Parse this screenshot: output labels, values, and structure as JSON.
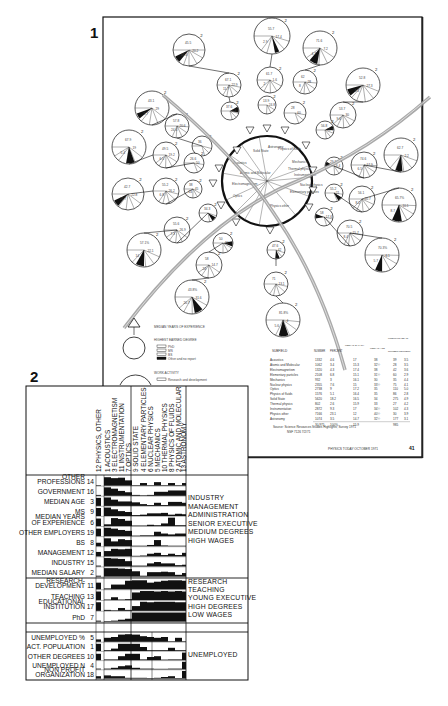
{
  "figure1": {
    "label": "1",
    "center_sectors": [
      "Solid State",
      "Acoustics",
      "Atomic and Molecular",
      "Electromagnetism",
      "Optics",
      "Physics other",
      "Astronomy",
      "Physics of fluids",
      "Nuclear physics",
      "Thermal physics",
      "Mechanics",
      "Instrumentation",
      "Elementary particles"
    ],
    "legend": {
      "median_years": "MEDIAN YEARS OF EXPERIENCE",
      "highest_degree": "HIGHEST EARNED DEGREE",
      "degree_items": [
        "PhD",
        "MS",
        "BS",
        "Other and no report"
      ],
      "work_activity": "WORK ACTIVITY",
      "work_items": [
        "Research and development"
      ]
    },
    "pies": [
      {
        "cx": 189,
        "cy": 50,
        "r": 16,
        "labels": [
          "45.5",
          "20.2",
          "41.4"
        ],
        "black": [
          160,
          185
        ]
      },
      {
        "cx": 272,
        "cy": 36,
        "r": 18,
        "labels": [
          "55.7",
          "17.4",
          "2.9"
        ],
        "black": [
          95,
          110
        ]
      },
      {
        "cx": 320,
        "cy": 48,
        "r": 17,
        "labels": [
          "71.6",
          "7.2",
          "4.7"
        ],
        "black": [
          130,
          160
        ]
      },
      {
        "cx": 229,
        "cy": 85,
        "r": 12,
        "labels": [
          "67.1",
          "22.9",
          "11.7"
        ],
        "black": null
      },
      {
        "cx": 270,
        "cy": 80,
        "r": 13,
        "labels": [
          "61.7",
          "1.6",
          "2"
        ],
        "black": null
      },
      {
        "cx": 305,
        "cy": 82,
        "r": 12,
        "labels": [
          "62",
          "28",
          "8"
        ],
        "black": null
      },
      {
        "cx": 363,
        "cy": 85,
        "r": 17,
        "labels": [
          "52.8",
          "27.3",
          "4.4"
        ],
        "black": [
          170,
          195
        ]
      },
      {
        "cx": 152,
        "cy": 108,
        "r": 17,
        "labels": [
          "43.1",
          "29",
          "5.7"
        ],
        "black": [
          170,
          190
        ]
      },
      {
        "cx": 230,
        "cy": 111,
        "r": 9,
        "labels": [
          "37.6",
          "4.4"
        ],
        "black": [
          0,
          40
        ]
      },
      {
        "cx": 267,
        "cy": 105,
        "r": 9,
        "labels": [
          "13.9",
          "24.8"
        ],
        "black": null
      },
      {
        "cx": 295,
        "cy": 113,
        "r": 11,
        "labels": [
          "28",
          "60"
        ],
        "black": null
      },
      {
        "cx": 343,
        "cy": 115,
        "r": 13,
        "labels": [
          "53.7",
          "30",
          "9.6"
        ],
        "black": null
      },
      {
        "cx": 177,
        "cy": 126,
        "r": 12,
        "labels": [
          "57.8",
          "20.6",
          "24.4"
        ],
        "black": null
      },
      {
        "cx": 325,
        "cy": 130,
        "r": 9,
        "labels": [
          "56.8",
          "33.3"
        ],
        "black": [
          0,
          30
        ]
      },
      {
        "cx": 129,
        "cy": 147,
        "r": 17,
        "labels": [
          "67.9",
          "19",
          "5.4"
        ],
        "black": [
          100,
          130
        ]
      },
      {
        "cx": 202,
        "cy": 146,
        "r": 10,
        "labels": [
          "36"
        ],
        "black": null
      },
      {
        "cx": 166,
        "cy": 155,
        "r": 13,
        "labels": [
          "49.5",
          "19.2",
          "6.5"
        ],
        "black": null
      },
      {
        "cx": 194,
        "cy": 163,
        "r": 10,
        "labels": [
          "26.6",
          "50"
        ],
        "black": null
      },
      {
        "cx": 334,
        "cy": 166,
        "r": 9,
        "labels": [
          "29.2",
          "9.4"
        ],
        "black": [
          210,
          240
        ]
      },
      {
        "cx": 364,
        "cy": 165,
        "r": 13,
        "labels": [
          "74.6",
          "17.9",
          "6.5"
        ],
        "black": null
      },
      {
        "cx": 401,
        "cy": 155,
        "r": 17,
        "labels": [
          "62.7",
          "2.2"
        ],
        "black": [
          115,
          140
        ]
      },
      {
        "cx": 128,
        "cy": 194,
        "r": 16,
        "labels": [
          "42.7",
          "22.8",
          "25.7"
        ],
        "black": [
          160,
          185
        ]
      },
      {
        "cx": 166,
        "cy": 191,
        "r": 13,
        "labels": [
          "55.2",
          "26.2",
          "6.8"
        ],
        "black": null
      },
      {
        "cx": 193,
        "cy": 189,
        "r": 9,
        "labels": [
          "38",
          "45",
          "24"
        ],
        "black": null
      },
      {
        "cx": 334,
        "cy": 193,
        "r": 9,
        "labels": [
          "55.2",
          "21"
        ],
        "black": [
          60,
          90
        ]
      },
      {
        "cx": 362,
        "cy": 199,
        "r": 13,
        "labels": [
          "56.1",
          "20.7",
          "8.2"
        ],
        "black": null
      },
      {
        "cx": 399,
        "cy": 205,
        "r": 17,
        "labels": [
          "65.7%",
          "10.1",
          "8.7"
        ],
        "black": [
          110,
          145
        ]
      },
      {
        "cx": 208,
        "cy": 213,
        "r": 9,
        "labels": [
          "34.3"
        ],
        "black": [
          60,
          90
        ]
      },
      {
        "cx": 177,
        "cy": 230,
        "r": 13,
        "labels": [
          "55.6",
          "26.9",
          "7.3"
        ],
        "black": null
      },
      {
        "cx": 324,
        "cy": 217,
        "r": 9,
        "labels": [
          "58",
          "17.6"
        ],
        "black": [
          200,
          230
        ]
      },
      {
        "cx": 223,
        "cy": 243,
        "r": 10,
        "labels": [
          "50",
          "24"
        ],
        "black": [
          20,
          50
        ]
      },
      {
        "cx": 350,
        "cy": 233,
        "r": 13,
        "labels": [
          "70.5",
          "15.7",
          "8.4"
        ],
        "black": null
      },
      {
        "cx": 144,
        "cy": 250,
        "r": 17,
        "labels": [
          "57.1%",
          "22.1",
          "14"
        ],
        "black": [
          120,
          150
        ]
      },
      {
        "cx": 382,
        "cy": 255,
        "r": 17,
        "labels": [
          "70.3%",
          "6.1",
          "5.7"
        ],
        "black": [
          120,
          145
        ]
      },
      {
        "cx": 276,
        "cy": 250,
        "r": 9,
        "labels": [
          "47.6",
          "42"
        ],
        "black": [
          95,
          125
        ]
      },
      {
        "cx": 209,
        "cy": 265,
        "r": 13,
        "labels": [
          "58",
          "14.7",
          "24"
        ],
        "black": null
      },
      {
        "cx": 276,
        "cy": 284,
        "r": 12,
        "labels": [
          "71",
          "13.1"
        ],
        "black": null
      },
      {
        "cx": 192,
        "cy": 297,
        "r": 17,
        "labels": [
          "43.8%",
          "31.6",
          "20.7"
        ],
        "black": [
          80,
          110
        ]
      },
      {
        "cx": 283,
        "cy": 320,
        "r": 17,
        "labels": [
          "81.8%",
          "4",
          "5.6"
        ],
        "black": [
          100,
          135
        ]
      }
    ],
    "table": {
      "headers": [
        "SUBFIELD",
        "NUMBER",
        "PERCENT",
        "MEDIAN SALARY (THOUSANDS OF DOLLARS)",
        "MEDIAN AGE",
        "UNEMPLOYED NUMBER",
        "UNEMPLOYED PERCENT"
      ],
      "rows": [
        [
          "Acoustics",
          "1332",
          "4.6",
          "17",
          "38",
          "39",
          "3.5"
        ],
        [
          "Atomic and Molecular",
          "1062",
          "3.4",
          "15.3",
          "32½",
          "28",
          "3.5"
        ],
        [
          "Electromagnetism",
          "1320",
          "4.3",
          "17.4",
          "38",
          "42",
          "3.6"
        ],
        [
          "Elementary particles",
          "2108",
          "6.8",
          "15.1",
          "31½",
          "60",
          "2.9"
        ],
        [
          "Mechanics",
          "932",
          "3",
          "16.1",
          "30",
          "35",
          "4.4"
        ],
        [
          "Nuclear physics",
          "2355",
          "7.6",
          "15",
          "33½",
          "75",
          "4.1"
        ],
        [
          "Optics",
          "2738",
          "9",
          "17.2",
          "35",
          "110",
          "5.0"
        ],
        [
          "Physics of fluids",
          "1576",
          "5.1",
          "16.4",
          "35",
          "86",
          "2.8"
        ],
        [
          "Solid State",
          "5620",
          "18.2",
          "16.5",
          "34",
          "275",
          "4.9"
        ],
        [
          "Thermal physics",
          "802",
          "2.6",
          "15.9",
          "33",
          "27",
          "4.2"
        ],
        [
          "Instrumentation",
          "2872",
          "9.3",
          "17",
          "34½",
          "102",
          "4.3"
        ],
        [
          "Physics other",
          "7166",
          "23.1",
          "12",
          "40½",
          "30",
          "3.9"
        ],
        [
          "Astronomy",
          "1074",
          "3.5",
          "14.7",
          "32½",
          "177",
          "3.1"
        ]
      ],
      "totals": [
        "",
        "30,975",
        "100%",
        "15.9",
        "",
        "985",
        ""
      ],
      "source": "Source: Science Resources Studies Highlights; Survey 1971",
      "source2": "NSF 7126  7/2/71",
      "footer": "PHYSICS TODAY   OCTOBER 1971",
      "page_number": "41"
    }
  },
  "figure2": {
    "label": "2",
    "columns": [
      "12 PHYSICS, OTHER",
      "1 ACOUSTICS",
      "3 ELECTROMAGNETISM",
      "11 INSTRUMENTATION",
      "7 OPTICS",
      "9 SOLID STATE",
      "4 ELEMENTARY PARTICLES",
      "6 NUCLEAR PHYSICS",
      "5 MECHANICS",
      "10 THERMAL PHYSICS",
      "8 PHYSICS OF FLUIDS",
      "2 ATOMIC AND MOLECULAR",
      "13 ASTRONOMY"
    ],
    "groups": [
      {
        "rows": [
          {
            "label": [
              "OTHER",
              "PROFESSIONS"
            ],
            "num": "14"
          },
          {
            "label": [
              "GOVERNMENT"
            ],
            "num": "16"
          },
          {
            "label": [
              "MEDIAN AGE"
            ],
            "num": "3"
          },
          {
            "label": [
              "MS"
            ],
            "num": "9"
          },
          {
            "label": [
              "MEDIAN YEARS",
              "OF EXPERIENCE"
            ],
            "num": "6"
          },
          {
            "label": [
              "OTHER EMPLOYERS"
            ],
            "num": "19"
          },
          {
            "label": [
              "BS"
            ],
            "num": "8"
          },
          {
            "label": [
              "MANAGEMENT"
            ],
            "num": "12"
          },
          {
            "label": [
              "INDUSTRY"
            ],
            "num": "15"
          },
          {
            "label": [
              "MEDIAN SALARY"
            ],
            "num": "2"
          }
        ],
        "side": [
          "INDUSTRY",
          "MANAGEMENT",
          "ADMINISTRATION",
          "SENIOR EXECUTIVE",
          "MEDIUM DEGREES",
          "HIGH WAGES"
        ]
      },
      {
        "rows": [
          {
            "label": [
              "RESEARCH-",
              "DEVELOPMENT"
            ],
            "num": "11"
          },
          {
            "label": [
              "TEACHING"
            ],
            "num": "13"
          },
          {
            "label": [
              "EDUCATIONAL",
              "INSTITUTION"
            ],
            "num": "17"
          },
          {
            "label": [
              "PhD"
            ],
            "num": "7"
          }
        ],
        "side": [
          "RESEARCH",
          "TEACHING",
          "YOUNG EXECUTIVE",
          "HIGH DEGREES",
          "LOW WAGES"
        ]
      },
      {
        "rows": [
          {
            "label": [
              "UNEMPLOYED %"
            ],
            "num": "5"
          },
          {
            "label": [
              "ACT. POPULATION"
            ],
            "num": "1"
          },
          {
            "label": [
              "OTHER DEGREES"
            ],
            "num": "10"
          },
          {
            "label": [
              "UNEMPLOYED N"
            ],
            "num": "4"
          },
          {
            "label": [
              "NON PROFIT",
              "ORGANIZATION"
            ],
            "num": "18"
          }
        ],
        "side": [
          "UNEMPLOYED"
        ]
      }
    ],
    "matrix_values": [
      [
        0.05,
        0.95,
        0.85,
        0.9,
        0.6,
        0.05,
        0.3,
        0.05,
        0.4,
        0.05,
        0.3,
        0.05,
        0.3
      ],
      [
        0.1,
        0.95,
        0.8,
        0.55,
        0.4,
        0.1,
        0.05,
        0.1,
        0.45,
        0.45,
        0.6,
        0.6,
        0.6
      ],
      [
        0.9,
        0.95,
        0.7,
        0.5,
        0.5,
        0.4,
        0.2,
        0.1,
        0.35,
        0.1,
        0.45,
        0.45,
        0.35
      ],
      [
        0.9,
        0.95,
        0.75,
        0.55,
        0.45,
        0.1,
        0.15,
        0.3,
        0.3,
        0.35,
        0.15,
        0.25,
        0.2
      ],
      [
        0.85,
        0.2,
        0.9,
        0.8,
        0.6,
        0.05,
        0.05,
        0.15,
        0.1,
        0.3,
        0.95,
        0.1,
        0.1
      ],
      [
        0.85,
        0.95,
        0.85,
        0.7,
        0.6,
        0.05,
        0.1,
        0.1,
        0.5,
        0.3,
        0.2,
        0.3,
        0.3
      ],
      [
        0.4,
        0.9,
        0.55,
        0.8,
        0.7,
        0.05,
        0.05,
        0.15,
        0.7,
        0.1,
        0.05,
        0.05,
        0.05
      ],
      [
        0.5,
        0.6,
        0.85,
        0.8,
        0.85,
        0.05,
        0.1,
        0.3,
        0.4,
        0.15,
        0.3,
        0.15,
        0.4
      ],
      [
        0.1,
        0.95,
        0.9,
        0.85,
        0.6,
        0.1,
        0.1,
        0.35,
        0.5,
        0.35,
        0.35,
        0.15,
        0.2
      ],
      [
        0.1,
        0.95,
        0.95,
        0.9,
        0.85,
        0.6,
        0.1,
        0.5,
        0.5,
        0.55,
        0.5,
        0.2,
        0.4
      ],
      [
        0.7,
        0.1,
        0.5,
        0.5,
        0.9,
        0.95,
        0.95,
        0.7,
        0.8,
        0.9,
        0.95,
        0.95,
        0.9
      ],
      [
        0.9,
        0.05,
        0.3,
        0.05,
        0.1,
        0.8,
        0.95,
        0.95,
        0.9,
        0.95,
        0.9,
        0.95,
        0.9
      ],
      [
        0.9,
        0.1,
        0.05,
        0.3,
        0.1,
        0.5,
        0.95,
        0.9,
        0.95,
        0.95,
        0.95,
        0.9,
        0.9
      ],
      [
        0.1,
        0.05,
        0.1,
        0.2,
        0.3,
        0.95,
        0.95,
        0.95,
        0.95,
        0.95,
        0.95,
        0.95,
        0.95
      ],
      [
        0.3,
        0.5,
        0.6,
        0.9,
        0.95,
        0.9,
        0.7,
        0.6,
        0.5,
        0.6,
        0.05,
        0.5,
        0.05
      ],
      [
        0.9,
        0.1,
        0.3,
        0.9,
        0.9,
        0.9,
        0.5,
        0.1,
        0.1,
        0.1,
        0.4,
        0.1,
        0.1
      ],
      [
        0.8,
        0.1,
        0.1,
        0.5,
        0.8,
        0.8,
        0.1,
        0.4,
        0.5,
        0.05,
        0.1,
        0.1,
        0.95
      ],
      [
        0.1,
        0.1,
        0.2,
        0.4,
        0.5,
        0.2,
        0.1,
        0.1,
        0.05,
        0.05,
        0.1,
        0.1,
        0.95
      ],
      [
        0.3,
        0.4,
        0.3,
        0.3,
        0.1,
        0.1,
        0.1,
        0.05,
        0.1,
        0.2,
        0.3,
        0.05,
        0.95
      ]
    ]
  },
  "colors": {
    "ink": "#111111",
    "paper": "#ffffff",
    "arc": "#9a9a9a",
    "shadow": "#d6d6d6"
  }
}
